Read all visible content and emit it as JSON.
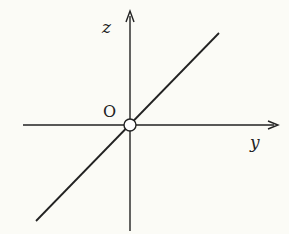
{
  "diagram": {
    "axes": {
      "horizontal_label": "y",
      "vertical_label": "z",
      "origin_label": "O"
    },
    "elements": [
      {
        "type": "axis",
        "name": "y-axis",
        "direction": "horizontal",
        "arrow": "right"
      },
      {
        "type": "axis",
        "name": "z-axis",
        "direction": "vertical",
        "arrow": "up"
      },
      {
        "type": "line",
        "name": "line-through-origin",
        "slope": "positive"
      },
      {
        "type": "point",
        "name": "origin",
        "style": "open-circle"
      }
    ],
    "colors": {
      "stroke": "#222222",
      "background": "#fbfbf6"
    }
  }
}
